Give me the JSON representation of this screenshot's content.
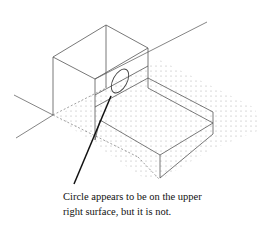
{
  "figure": {
    "colors": {
      "line": "#555555",
      "leader": "#111111",
      "dots": "#9a9a9a",
      "background": "#ffffff"
    }
  },
  "caption": {
    "line1": "Circle appears to be on the upper",
    "line2": "right surface, but it is not."
  }
}
